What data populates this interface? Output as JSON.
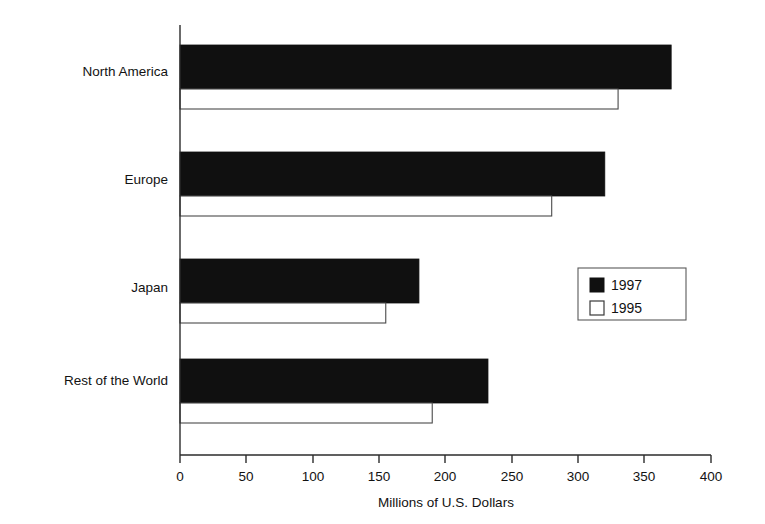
{
  "chart_data": {
    "type": "bar",
    "orientation": "horizontal",
    "title": "",
    "xlabel": "Millions of U.S. Dollars",
    "ylabel": "",
    "xlim": [
      0,
      400
    ],
    "xticks": [
      0,
      50,
      100,
      150,
      200,
      250,
      300,
      350,
      400
    ],
    "xtick_labels": [
      "0",
      "50",
      "100",
      "150",
      "200",
      "250",
      "300",
      "350",
      "400"
    ],
    "grid": false,
    "categories": [
      "North America",
      "Europe",
      "Japan",
      "Rest of the World"
    ],
    "series": [
      {
        "name": "1997",
        "values": [
          370,
          320,
          180,
          232
        ],
        "color": "#101010",
        "style": "filled"
      },
      {
        "name": "1995",
        "values": [
          330,
          280,
          155,
          190
        ],
        "color": "#ffffff",
        "style": "open"
      }
    ],
    "legend": {
      "position": "center-right",
      "entries": [
        {
          "label": "1997",
          "style": "filled"
        },
        {
          "label": "1995",
          "style": "open"
        }
      ]
    }
  },
  "axis": {
    "x_title": "Millions of U.S. Dollars",
    "tick_0": "0",
    "tick_50": "50",
    "tick_100": "100",
    "tick_150": "150",
    "tick_200": "200",
    "tick_250": "250",
    "tick_300": "300",
    "tick_350": "350",
    "tick_400": "400"
  },
  "categories": {
    "north_america": "North America",
    "europe": "Europe",
    "japan": "Japan",
    "rest_of_world": "Rest of the World"
  },
  "legend": {
    "entry_1997": "1997",
    "entry_1995": "1995"
  }
}
